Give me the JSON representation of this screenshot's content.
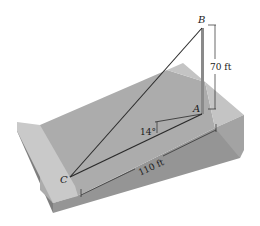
{
  "figure": {
    "points": {
      "A": {
        "label": "A"
      },
      "B": {
        "label": "B"
      },
      "C": {
        "label": "C"
      }
    },
    "dimensions": {
      "height_AB": "70 ft",
      "length_CA": "110 ft",
      "slope_angle": "14°"
    },
    "colors": {
      "slope_face": "#a9a9a9",
      "side_face": "#9a9a9a",
      "end_strip": "#c8c8c8",
      "front_face": "#8f8f8f",
      "line": "#2a2a2a",
      "pole": "#8a8a8a"
    }
  }
}
